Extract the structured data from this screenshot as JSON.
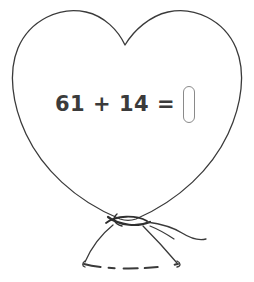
{
  "worksheet": {
    "background_color": "#ffffff",
    "ink_color": "#3b3b3b",
    "box_border_color": "#8a8a8a",
    "illustration_name": "heart-balloon-with-ribbon"
  },
  "problem": {
    "first_operand": "61",
    "operator": "+",
    "second_operand": "14",
    "equals": "=",
    "expression": "61 + 14 =",
    "answer_value": "",
    "answer_placeholder": ""
  }
}
